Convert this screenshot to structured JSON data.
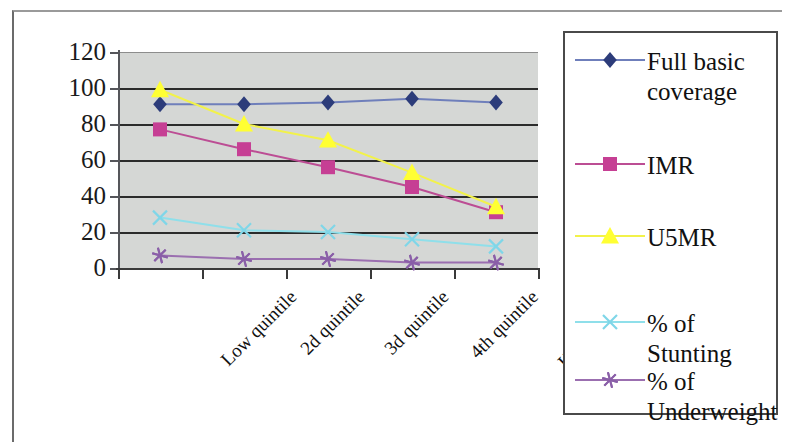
{
  "chart_data": {
    "type": "line",
    "title": "",
    "xlabel": "",
    "ylabel": "",
    "categories": [
      "Low quintile",
      "2d quintile",
      "3d quintile",
      "4th quintile",
      "High quintile"
    ],
    "ylim": [
      0,
      120
    ],
    "yticks": [
      0,
      20,
      40,
      60,
      80,
      100,
      120
    ],
    "ytick_labels": [
      "0",
      "20",
      "40",
      "60",
      "80",
      "100",
      "120"
    ],
    "grid": true,
    "legend_position": "right",
    "series": [
      {
        "name": "Full basic coverage",
        "color": "#2c3c7a",
        "line_color": "#6f7fbb",
        "marker": "diamond",
        "values": [
          91,
          91,
          92,
          94,
          92
        ]
      },
      {
        "name": "IMR",
        "color": "#c63f94",
        "line_color": "#bc4d94",
        "marker": "square",
        "values": [
          77,
          66,
          56,
          45,
          31
        ]
      },
      {
        "name": "U5MR",
        "color": "#ffff33",
        "line_color": "#f2f24a",
        "marker": "triangle",
        "values": [
          99,
          80,
          71,
          53,
          34
        ]
      },
      {
        "name": "% of Stunting",
        "color": "#7fd6e8",
        "line_color": "#8fdfea",
        "marker": "cross",
        "values": [
          28,
          21,
          20,
          16,
          12
        ]
      },
      {
        "name": "% of Underweight",
        "color": "#8a5fa8",
        "line_color": "#9b6fb0",
        "marker": "star",
        "values": [
          7,
          5,
          5,
          3,
          3
        ]
      }
    ]
  },
  "legend": {
    "entries": [
      {
        "label": "Full basic\ncoverage"
      },
      {
        "label": "IMR"
      },
      {
        "label": "U5MR"
      },
      {
        "label": "% of Stunting"
      },
      {
        "label": "% of\nUnderweight"
      }
    ]
  },
  "colors": {
    "plot_background": "#d5d7d5",
    "gridline": "#2b2b2b",
    "axis": "#3a3a3a",
    "page_background": "#ffffff",
    "text": "#111111"
  }
}
